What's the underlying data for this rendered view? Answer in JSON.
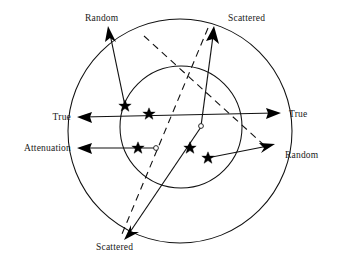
{
  "figure": {
    "title_text": "",
    "background_color": "#ffffff",
    "stroke_color": "#111111",
    "text_color": "#1a1a1a",
    "width": 341,
    "height": 256
  },
  "labels": {
    "random_top": "Random",
    "scattered_top": "Scattered",
    "true_left": "True",
    "true_right": "True",
    "attenuation_left": "Attenuation",
    "random_right": "Random",
    "scattered_bottom": "Scattered"
  },
  "circles": [
    {
      "name": "outer-circle",
      "cx": 180,
      "cy": 131,
      "r": 112
    },
    {
      "name": "inner-circle",
      "cx": 181,
      "cy": 127,
      "r": 61
    }
  ],
  "events": [
    {
      "name": "random-event-upper-left",
      "type": "star",
      "x": 125,
      "y": 106
    },
    {
      "name": "true-event-center",
      "type": "star",
      "x": 149,
      "y": 113
    },
    {
      "name": "attenuation-event",
      "type": "star",
      "x": 138,
      "y": 148
    },
    {
      "name": "random-event-lower-right",
      "type": "star",
      "x": 189,
      "y": 148
    },
    {
      "name": "random-event-lower-right-2",
      "type": "star",
      "x": 210,
      "y": 158
    },
    {
      "name": "annihilation-origin-dot",
      "type": "open-dot",
      "x": 155,
      "y": 148
    },
    {
      "name": "scatter-origin-dot",
      "type": "open-dot",
      "x": 201,
      "y": 126
    }
  ],
  "rays": [
    {
      "name": "true-horizontal-ray",
      "style": "solid",
      "arrow_start": true,
      "arrow_end": true
    },
    {
      "name": "attenuation-ray",
      "style": "solid",
      "arrow_start": true,
      "arrow_end": false
    },
    {
      "name": "random-ray-upper-left",
      "style": "solid",
      "arrow_start": false,
      "arrow_end": true
    },
    {
      "name": "scattered-ray-upper-right",
      "style": "solid",
      "arrow_start": false,
      "arrow_end": true
    },
    {
      "name": "random-ray-lower-right",
      "style": "solid",
      "arrow_start": false,
      "arrow_end": true
    },
    {
      "name": "scattered-ray-lower-left",
      "style": "solid",
      "arrow_start": false,
      "arrow_end": true
    },
    {
      "name": "dashed-line-upper-left-to-lower-right",
      "style": "dashed"
    },
    {
      "name": "dashed-line-scattered-to-bottom",
      "style": "dashed"
    }
  ]
}
